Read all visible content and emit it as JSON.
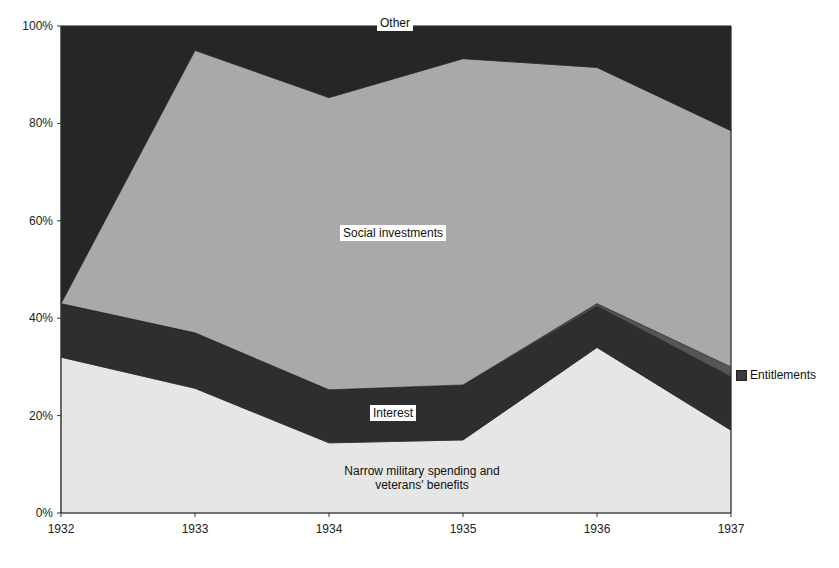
{
  "chart_data": {
    "type": "area",
    "stacked": true,
    "percent": true,
    "title": "",
    "xlabel": "",
    "ylabel": "",
    "categories": [
      "1932",
      "1933",
      "1934",
      "1935",
      "1936",
      "1937"
    ],
    "y_ticks": [
      "0%",
      "20%",
      "40%",
      "60%",
      "80%",
      "100%"
    ],
    "ylim": [
      0,
      100
    ],
    "grid": false,
    "series": [
      {
        "name": "Narrow military spending and veterans' benefits",
        "color": "#e6e6e6",
        "values": [
          32,
          25.6,
          14.4,
          15,
          34,
          17
        ]
      },
      {
        "name": "Interest",
        "color": "#2e2e2e",
        "values": [
          11,
          11.4,
          10.9,
          11.3,
          8.5,
          11
        ]
      },
      {
        "name": "Entitlements",
        "color": "#555555",
        "values": [
          0,
          0,
          0,
          0,
          0.5,
          2
        ]
      },
      {
        "name": "Social investments",
        "color": "#a9a9a9",
        "values": [
          0,
          58,
          60,
          67,
          48.5,
          48.5
        ]
      },
      {
        "name": "Other",
        "color": "#262626",
        "values": [
          57,
          5,
          14.7,
          6.7,
          8.5,
          21.5
        ]
      }
    ],
    "labels": {
      "other": "Other",
      "social": "Social investments",
      "interest": "Interest",
      "military_line1": "Narrow military spending and",
      "military_line2": "veterans' benefits"
    },
    "legend": {
      "position": "right",
      "entries": [
        "Entitlements"
      ]
    }
  }
}
